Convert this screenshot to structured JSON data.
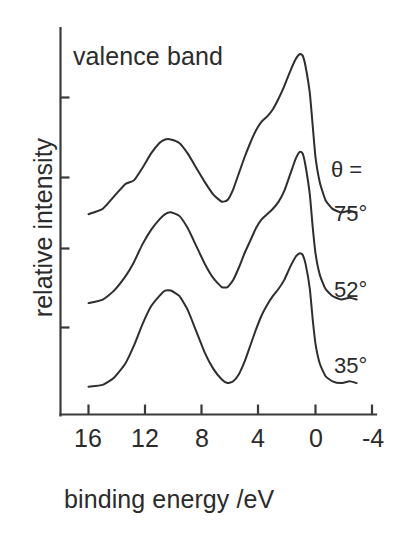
{
  "figure": {
    "title": "valence band",
    "xlabel": "binding energy /eV",
    "ylabel": "relative intensity",
    "theta_label": "θ ="
  },
  "axis": {
    "x_ticks": [
      "16",
      "12",
      "8",
      "4",
      "0",
      "-4"
    ],
    "y_ticks_labeled": false
  },
  "series_labels": {
    "s75": "75°",
    "s52": "52°",
    "s35": "35°"
  },
  "colors": {
    "curve": "#2e2e2e",
    "axis": "#3a3a3a",
    "text": "#2b2b2b",
    "background": "#ffffff"
  },
  "chart_data": {
    "type": "line",
    "title": "valence band",
    "xlabel": "binding energy /eV",
    "ylabel": "relative intensity",
    "xlim": [
      17,
      -5
    ],
    "x_ticks": [
      16,
      12,
      8,
      4,
      0,
      -4
    ],
    "x_axis_inverted": true,
    "ylim": [
      0,
      1
    ],
    "y_tick_labels": [],
    "grid": false,
    "legend": "right-inline",
    "annotations": [
      "θ =",
      "75°",
      "52°",
      "35°"
    ],
    "note": "Angle-resolved photoemission valence-band spectra at three emission angles, curves vertically offset.",
    "series": [
      {
        "name": "75°",
        "offset_note": "top curve",
        "x": [
          16.0,
          15.0,
          14.2,
          13.4,
          12.8,
          12.2,
          11.6,
          11.0,
          10.6,
          10.2,
          9.6,
          9.0,
          8.4,
          7.8,
          7.2,
          6.6,
          6.2,
          5.8,
          5.4,
          5.0,
          4.6,
          4.2,
          3.8,
          3.4,
          3.0,
          2.6,
          2.2,
          1.8,
          1.4,
          1.1,
          0.9,
          0.7,
          0.4,
          0.2,
          0.0,
          -0.3,
          -0.7,
          -1.2,
          -1.8,
          -2.4,
          -2.9
        ],
        "y": [
          0.1,
          0.13,
          0.2,
          0.27,
          0.29,
          0.36,
          0.44,
          0.5,
          0.52,
          0.52,
          0.5,
          0.44,
          0.36,
          0.28,
          0.21,
          0.17,
          0.18,
          0.24,
          0.33,
          0.42,
          0.5,
          0.57,
          0.62,
          0.65,
          0.69,
          0.75,
          0.82,
          0.9,
          0.97,
          1.0,
          0.99,
          0.93,
          0.78,
          0.6,
          0.42,
          0.28,
          0.18,
          0.13,
          0.11,
          0.12,
          0.11
        ]
      },
      {
        "name": "52°",
        "offset_note": "middle curve",
        "x": [
          16.0,
          15.0,
          14.2,
          13.4,
          12.8,
          12.2,
          11.6,
          11.0,
          10.6,
          10.2,
          9.6,
          9.0,
          8.4,
          7.8,
          7.2,
          6.6,
          6.2,
          5.8,
          5.4,
          5.0,
          4.6,
          4.2,
          3.8,
          3.4,
          3.0,
          2.6,
          2.2,
          1.8,
          1.4,
          1.1,
          0.9,
          0.7,
          0.4,
          0.2,
          0.0,
          -0.3,
          -0.7,
          -1.2,
          -1.8,
          -2.4,
          -2.9
        ],
        "y": [
          0.05,
          0.07,
          0.12,
          0.2,
          0.28,
          0.38,
          0.46,
          0.52,
          0.55,
          0.56,
          0.54,
          0.47,
          0.37,
          0.27,
          0.19,
          0.14,
          0.14,
          0.18,
          0.25,
          0.33,
          0.4,
          0.47,
          0.52,
          0.55,
          0.58,
          0.62,
          0.68,
          0.77,
          0.86,
          0.9,
          0.89,
          0.82,
          0.66,
          0.48,
          0.33,
          0.21,
          0.13,
          0.09,
          0.07,
          0.08,
          0.07
        ]
      },
      {
        "name": "35°",
        "offset_note": "bottom curve",
        "x": [
          16.0,
          15.0,
          14.2,
          13.4,
          12.8,
          12.2,
          11.6,
          11.0,
          10.6,
          10.2,
          9.6,
          9.0,
          8.4,
          7.8,
          7.2,
          6.6,
          6.2,
          5.8,
          5.4,
          5.0,
          4.6,
          4.2,
          3.8,
          3.4,
          3.0,
          2.6,
          2.2,
          1.8,
          1.4,
          1.1,
          0.9,
          0.7,
          0.4,
          0.2,
          0.0,
          -0.3,
          -0.7,
          -1.2,
          -1.8,
          -2.4,
          -2.9
        ],
        "y": [
          0.03,
          0.04,
          0.08,
          0.16,
          0.26,
          0.38,
          0.48,
          0.54,
          0.57,
          0.57,
          0.54,
          0.46,
          0.34,
          0.22,
          0.13,
          0.07,
          0.05,
          0.06,
          0.1,
          0.17,
          0.26,
          0.35,
          0.43,
          0.49,
          0.54,
          0.58,
          0.63,
          0.7,
          0.76,
          0.78,
          0.77,
          0.72,
          0.58,
          0.41,
          0.27,
          0.16,
          0.09,
          0.06,
          0.05,
          0.06,
          0.05
        ]
      }
    ]
  }
}
